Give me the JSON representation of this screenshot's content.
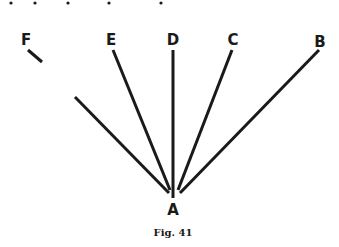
{
  "figure": {
    "caption": "Fig. 41",
    "vertex_label": "A",
    "ray_labels": [
      "F",
      "E",
      "D",
      "C",
      "B"
    ],
    "dots_count": 5
  }
}
